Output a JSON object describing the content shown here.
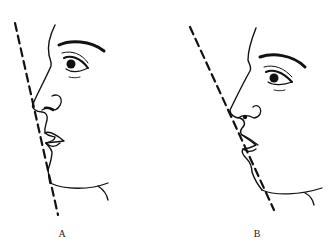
{
  "figure": {
    "panels": [
      {
        "label": "A"
      },
      {
        "label": "B"
      }
    ],
    "line_color": "#111111",
    "background": "#ffffff"
  }
}
